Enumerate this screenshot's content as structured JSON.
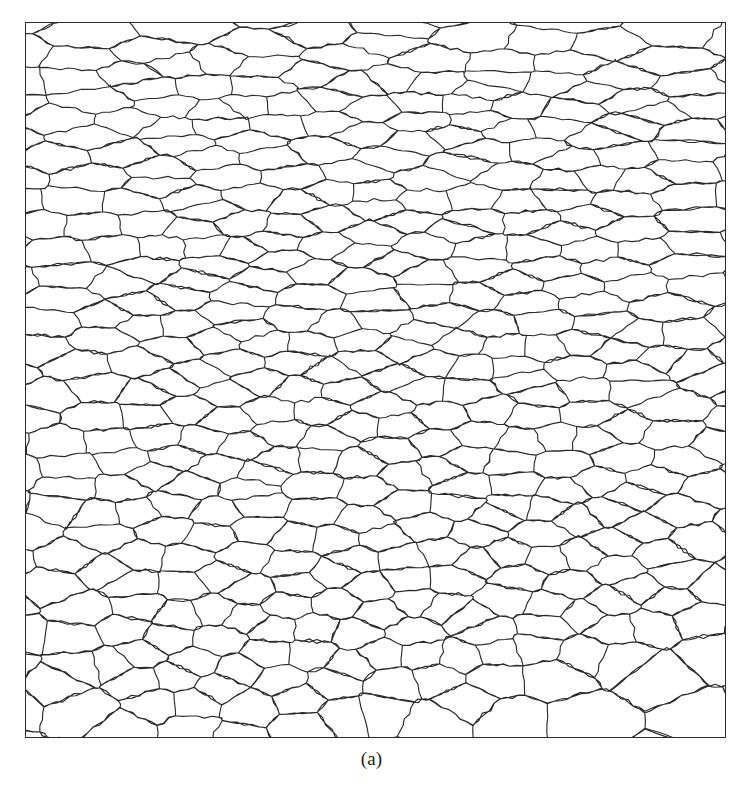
{
  "figure": {
    "caption": "(a)",
    "kind": "grain-boundary-microstructure",
    "background_color": "#ffffff",
    "line_color": "#2b2b2b",
    "frame_color": "#2b2b2b",
    "line_width": 1.15
  },
  "panel": {
    "x": 25,
    "y": 22,
    "width": 701,
    "height": 716,
    "border_width": 1
  },
  "chart_data": {
    "type": "diagram",
    "title": "(a)",
    "subtype": "voronoi-grain-tessellation",
    "grain_count": 470,
    "seed": 20240917,
    "anisotropy_top": 2.95,
    "anisotropy_bottom": 1.55,
    "relaxation_iterations": 3,
    "edge_waviness_amplitude": 1.5,
    "edge_segment_length": 7,
    "xlabel": "",
    "ylabel": "",
    "grid": false,
    "legend": false
  }
}
